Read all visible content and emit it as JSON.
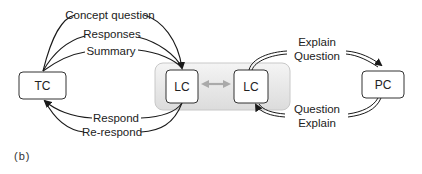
{
  "diagram": {
    "nodes": {
      "tc": "TC",
      "lc_left": "LC",
      "lc_right": "LC",
      "pc": "PC"
    },
    "edges": {
      "tc_to_lc": [
        "Concept question",
        "Responses",
        "Summary"
      ],
      "lc_to_tc": [
        "Respond",
        "Re-respond"
      ],
      "lc_to_pc": [
        "Explain",
        "Question"
      ],
      "pc_to_lc": [
        "Question",
        "Explain"
      ]
    },
    "caption": "(b)",
    "colors": {
      "line": "#1a1a1a",
      "box_border": "#333333",
      "group_fill": "#e9e9e9",
      "double_arrow": "#aaaaaa"
    }
  }
}
